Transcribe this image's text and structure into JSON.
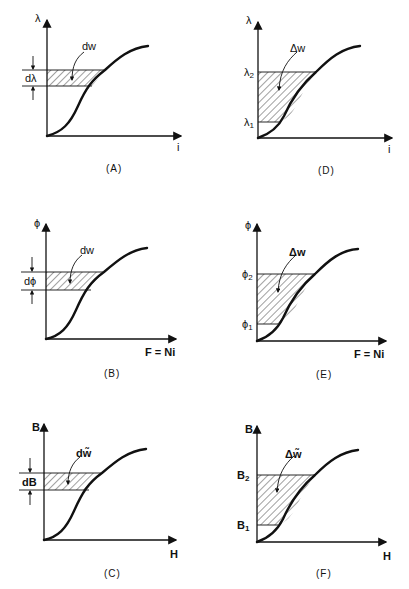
{
  "figure": {
    "panels": [
      {
        "id": "A",
        "caption": "(A)",
        "y_axis": "λ",
        "x_axis": "i",
        "area_label": "dw",
        "band_label": "dλ",
        "type": "differential"
      },
      {
        "id": "B",
        "caption": "(B)",
        "y_axis": "ϕ",
        "x_axis": "F = Ni",
        "area_label": "dw",
        "band_label": "dϕ",
        "type": "differential"
      },
      {
        "id": "C",
        "caption": "(C)",
        "y_axis": "B",
        "x_axis": "H",
        "area_label": "dw̃",
        "band_label": "dB",
        "type": "differential"
      },
      {
        "id": "D",
        "caption": "(D)",
        "y_axis": "λ",
        "x_axis": "i",
        "area_label": "Δw",
        "upper_label": "λ",
        "upper_sub": "2",
        "lower_label": "λ",
        "lower_sub": "1",
        "type": "finite"
      },
      {
        "id": "E",
        "caption": "(E)",
        "y_axis": "ϕ",
        "x_axis": "F = Ni",
        "area_label": "Δw",
        "upper_label": "ϕ",
        "upper_sub": "2",
        "lower_label": "ϕ",
        "lower_sub": "1",
        "type": "finite"
      },
      {
        "id": "F",
        "caption": "(F)",
        "y_axis": "B",
        "x_axis": "H",
        "area_label": "Δw̃",
        "upper_label": "B",
        "upper_sub": "2",
        "lower_label": "B",
        "lower_sub": "1",
        "type": "finite"
      }
    ]
  }
}
